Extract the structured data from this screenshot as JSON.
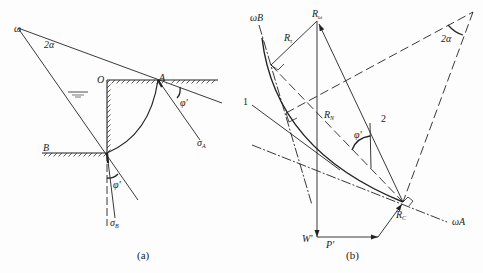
{
  "figure": {
    "panel_a": {
      "caption": "(a)",
      "labels": {
        "omega": "ω",
        "angle_2a": "2α",
        "O": "O",
        "A": "A",
        "B": "B",
        "phi_A": "φ'",
        "phi_B": "φ'",
        "sigma_A": "σ",
        "sigma_A_sub": "A",
        "sigma_B": "σ",
        "sigma_B_sub": "B"
      }
    },
    "panel_b": {
      "caption": "(b)",
      "labels": {
        "omega_B": "ωB",
        "omega_A": "ωA",
        "R_omega": "R",
        "R_omega_sub": "ω",
        "R_tau": "R",
        "R_tau_sub": "τ",
        "R_N": "R",
        "R_N_sub": "N",
        "R_C": "R",
        "R_C_sub": "C",
        "phi": "φ'",
        "angle_2a": "2α",
        "W": "W'",
        "P": "P'",
        "line_1": "1",
        "line_2": "2"
      }
    }
  }
}
